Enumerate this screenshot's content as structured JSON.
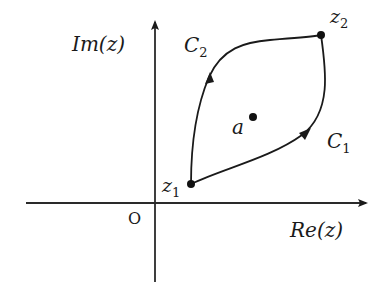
{
  "diagram": {
    "axes": {
      "x_label": "Re(z)",
      "y_label": "Im(z)",
      "origin_label": "O"
    },
    "points": {
      "z1": {
        "label": "z",
        "subscript": "1"
      },
      "z2": {
        "label": "z",
        "subscript": "2"
      },
      "a": {
        "label": "a"
      }
    },
    "paths": [
      {
        "name": "C1",
        "label": "C",
        "subscript": "1",
        "from": "z1",
        "to": "z2",
        "side": "lower-right"
      },
      {
        "name": "C2",
        "label": "C",
        "subscript": "2",
        "from": "z1",
        "to": "z2",
        "side": "upper-left"
      }
    ],
    "colors": {
      "ink": "#1a1a1a",
      "background": "#ffffff"
    }
  }
}
